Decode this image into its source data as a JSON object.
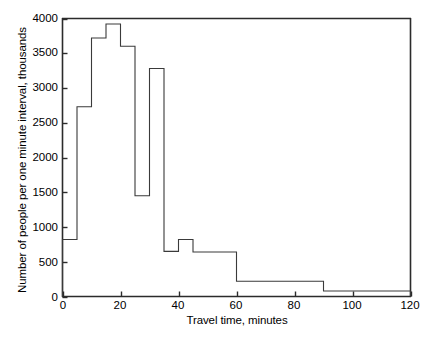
{
  "chart_data": {
    "type": "bar",
    "title": "",
    "subtitle": "",
    "xlabel": "Travel time, minutes",
    "ylabel": "Number of people per one minute interval, thousands",
    "xlim": [
      0,
      120
    ],
    "ylim": [
      0,
      4000
    ],
    "xticks": [
      0,
      20,
      40,
      60,
      80,
      100,
      120
    ],
    "xtick_labels": [
      "0",
      "20",
      "40",
      "60",
      "80",
      "100",
      "120"
    ],
    "yticks": [
      0,
      500,
      1000,
      1500,
      2000,
      2500,
      3000,
      3500,
      4000
    ],
    "ytick_labels": [
      "0",
      "500",
      "1000",
      "1500",
      "2000",
      "2500",
      "3000",
      "3500",
      "4000"
    ],
    "grid": false,
    "legend": null,
    "style": "step-histogram-outline",
    "line_color": "#3a3a3a",
    "fill_color": "none",
    "bin_edges": [
      0,
      5,
      10,
      15,
      20,
      25,
      30,
      35,
      40,
      45,
      60,
      90,
      120
    ],
    "bin_labels": [
      "0-5",
      "5-10",
      "10-15",
      "15-20",
      "20-25",
      "25-30",
      "30-35",
      "35-40",
      "40-45",
      "45-60",
      "60-90",
      "90-120"
    ],
    "values": [
      820,
      2730,
      3720,
      3920,
      3600,
      1450,
      3280,
      650,
      820,
      640,
      220,
      80
    ],
    "annotations": []
  },
  "figure": {
    "background": "#ffffff",
    "axis_color": "#2b2b2b"
  }
}
